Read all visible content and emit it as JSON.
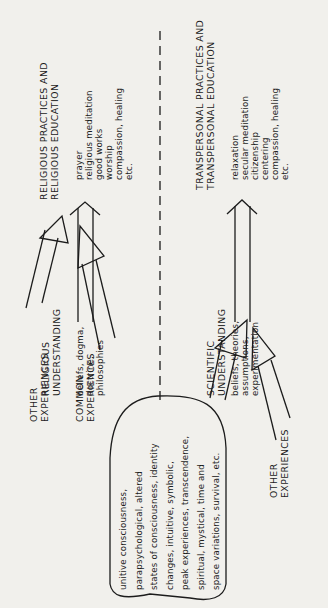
{
  "diagram": {
    "top_half": {
      "inputs": [
        {
          "label": [
            "OTHER",
            "EXPERIENCES"
          ]
        },
        {
          "label": [
            "COMMON",
            "EXPERIENCES"
          ]
        }
      ],
      "understanding": {
        "title": [
          "RELIGIOUS",
          "UNDERSTANDING"
        ],
        "items": [
          "beliefs, dogma,",
          "doctrine,",
          "philosophies"
        ]
      },
      "practices": {
        "title": [
          "RELIGIOUS  PRACTICES  AND",
          "RELIGIOUS  EDUCATION"
        ],
        "items": [
          "prayer",
          "religious meditation",
          "good works",
          "worship",
          "compassion, healing",
          "etc."
        ]
      }
    },
    "bottom_half": {
      "inputs": [
        {
          "label": [
            "OTHER",
            "EXPERIENCES"
          ]
        }
      ],
      "understanding": {
        "title": [
          "SCIENTIFIC",
          "UNDERSTANDING"
        ],
        "items": [
          "beliefs, theories,",
          "assumptions,",
          "experimentation"
        ]
      },
      "practices": {
        "title": [
          "TRANSPERSONAL  PRACTICES  AND",
          "TRANSPERSONAL  EDUCATION"
        ],
        "items": [
          "relaxation",
          "secular meditation",
          "citizenship",
          "centering",
          "compassion, healing",
          "etc."
        ]
      }
    },
    "core_experiences": [
      "unitive consciousness,",
      "parapsychological,  altered",
      "states of consciousness,  identity",
      "changes,  intuitive,  symbolic,",
      "peak experiences,  transcendence,",
      "spiritual,  mystical,  time and",
      "space variations,  survival,  etc."
    ],
    "colors": {
      "background": "#f1f0ec",
      "ink": "#1c1c1c"
    }
  }
}
